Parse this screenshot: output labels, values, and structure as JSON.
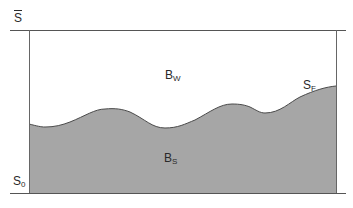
{
  "diagram": {
    "labels": {
      "top_boundary": {
        "base": "S",
        "sub": "",
        "overbar": true
      },
      "bottom_boundary": {
        "base": "S",
        "sub": "0"
      },
      "upper_region": {
        "base": "B",
        "sub": "W"
      },
      "lower_region": {
        "base": "B",
        "sub": "S"
      },
      "interface": {
        "base": "S",
        "sub": "F"
      }
    },
    "colors": {
      "fill_lower": "#a6a6a6",
      "line": "#555555",
      "curve": "#4a4a4a",
      "background": "#ffffff"
    },
    "geometry": {
      "box": {
        "left": 29,
        "right": 336,
        "top": 30,
        "bottom": 193
      },
      "top_line": {
        "x1": 10,
        "x2": 346,
        "y": 30
      },
      "bottom_line": {
        "x1": 10,
        "x2": 346,
        "y": 193
      },
      "curve_points": [
        [
          29,
          124
        ],
        [
          45,
          127
        ],
        [
          70,
          122
        ],
        [
          105,
          109
        ],
        [
          130,
          112
        ],
        [
          165,
          128
        ],
        [
          195,
          120
        ],
        [
          232,
          104
        ],
        [
          250,
          107
        ],
        [
          265,
          113
        ],
        [
          300,
          97
        ],
        [
          336,
          86
        ]
      ]
    }
  }
}
